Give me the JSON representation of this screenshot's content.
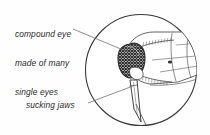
{
  "figure": {
    "type": "scientific-illustration",
    "background_color": "#fefefe",
    "ink_color": "#3a3a3a",
    "eye_fill_color": "#4a4a4a",
    "lens": {
      "shape": "circle",
      "center_x": 141,
      "center_y": 70,
      "radius": 56
    },
    "labels": [
      {
        "id": "compound-eye",
        "line1": "compound eye",
        "line2": "made of many",
        "line3": "single eyes"
      },
      {
        "id": "sucking-jaws",
        "text": "sucking jaws"
      }
    ],
    "parts": [
      {
        "name": "compound-eye"
      },
      {
        "name": "proboscis"
      },
      {
        "name": "thorax"
      },
      {
        "name": "antenna"
      },
      {
        "name": "palp"
      },
      {
        "name": "wing"
      }
    ]
  }
}
